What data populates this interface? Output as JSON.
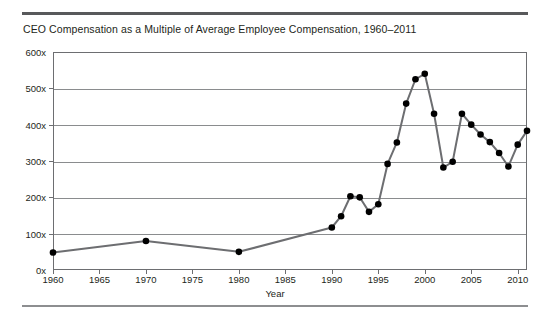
{
  "figure": {
    "title": "CEO Compensation as a Multiple of Average Employee Compensation, 1960–2011",
    "x_axis_title": "Year",
    "line_color": "#6d6e71",
    "marker_color": "#000000",
    "grid_color": "#8a8c8e",
    "rule_color": "#58595b"
  },
  "chart_data": {
    "type": "line",
    "title": "CEO Compensation as a Multiple of Average Employee Compensation, 1960–2011",
    "xlabel": "Year",
    "ylabel": "",
    "xlim": [
      1960,
      2011
    ],
    "ylim": [
      0,
      600
    ],
    "grid": true,
    "legend": "none",
    "ytick_labels": [
      "0x",
      "100x",
      "200x",
      "300x",
      "400x",
      "500x",
      "600x"
    ],
    "ytick_values": [
      0,
      100,
      200,
      300,
      400,
      500,
      600
    ],
    "xtick_labels": [
      "1960",
      "1965",
      "1970",
      "1975",
      "1980",
      "1985",
      "1990",
      "1995",
      "2000",
      "2005",
      "2010"
    ],
    "xtick_values": [
      1960,
      1965,
      1970,
      1975,
      1980,
      1985,
      1990,
      1995,
      2000,
      2005,
      2010
    ],
    "series": [
      {
        "name": "CEO compensation multiple",
        "x": [
          1960,
          1970,
          1980,
          1990,
          1991,
          1992,
          1993,
          1994,
          1995,
          1996,
          1997,
          1998,
          1999,
          2000,
          2001,
          2002,
          2003,
          2004,
          2005,
          2006,
          2007,
          2008,
          2009,
          2010,
          2011
        ],
        "values": [
          48,
          80,
          50,
          117,
          148,
          203,
          200,
          160,
          181,
          292,
          351,
          458,
          525,
          540,
          430,
          282,
          298,
          430,
          400,
          373,
          352,
          322,
          285,
          345,
          383
        ]
      }
    ]
  }
}
